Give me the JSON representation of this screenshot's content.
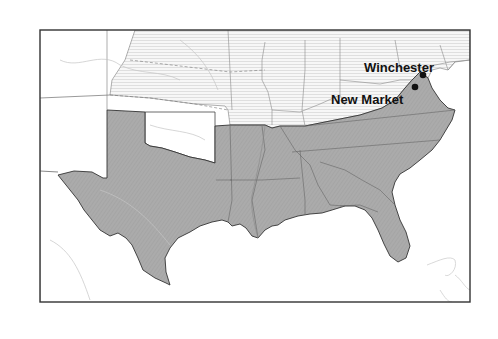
{
  "map": {
    "title": "",
    "colors": {
      "confederate_fill": "#a9a9a9",
      "union_fill": "#f3f3f3",
      "territory_fill": "#ffffff",
      "water": "#ffffff",
      "border": "#333333",
      "state_line": "#6e6e6e",
      "river": "#bdbdbd"
    },
    "regions": [
      {
        "name": "Union states",
        "style": "light horizontal hatching"
      },
      {
        "name": "Confederate states",
        "style": "dark gray shading"
      },
      {
        "name": "Western territories",
        "style": "white"
      }
    ],
    "cities": [
      {
        "id": "winchester",
        "label": "Winchester",
        "x": 423,
        "y": 75,
        "label_x": 364,
        "label_y": 72
      },
      {
        "id": "new-market",
        "label": "New Market",
        "x": 415,
        "y": 87,
        "label_x": 331,
        "label_y": 104
      }
    ]
  }
}
